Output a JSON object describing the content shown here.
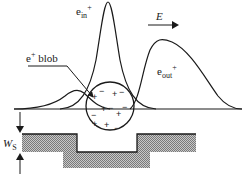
{
  "labels": {
    "e_in": {
      "base": "e",
      "sub": "in",
      "sup": "+"
    },
    "e_out": {
      "base": "e",
      "sub": "out",
      "sup": "+"
    },
    "field": "E",
    "blob": {
      "base": "e",
      "sup": "+",
      "text": " blob"
    },
    "ws": {
      "base": "W",
      "sub": "S"
    }
  },
  "blob_charges": [
    "+",
    "−",
    "+",
    "−",
    "+",
    "−",
    "+",
    "−",
    "+",
    "−",
    "+",
    "−"
  ],
  "colors": {
    "line": "#1a1a1a",
    "hatch": "#9a9a9a"
  }
}
